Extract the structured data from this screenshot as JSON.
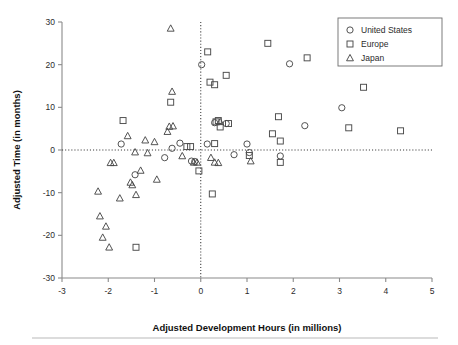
{
  "chart_data": {
    "type": "scatter",
    "title": "",
    "xlabel": "Adjusted Development Hours (in millions)",
    "ylabel": "Adjusted Time (in months)",
    "xlim": [
      -3,
      5
    ],
    "ylim": [
      -30,
      30
    ],
    "xticks": [
      -3,
      -2,
      -1,
      0,
      1,
      2,
      3,
      4,
      5
    ],
    "yticks": [
      -30,
      -20,
      -10,
      0,
      10,
      20,
      30
    ],
    "xtick_labels": [
      "-3",
      "-2",
      "-1",
      "0",
      "1",
      "2",
      "3",
      "4",
      "5"
    ],
    "ytick_labels": [
      "-30",
      "-20",
      "-10",
      "0",
      "10",
      "20",
      "30"
    ],
    "grid": false,
    "reference_lines": [
      {
        "axis": "y",
        "value": 0,
        "style": "dotted"
      },
      {
        "axis": "x",
        "value": 0,
        "style": "dotted"
      }
    ],
    "legend_position": "top-right",
    "series": [
      {
        "name": "United States",
        "marker": "circle",
        "points": [
          [
            -1.72,
            1.4
          ],
          [
            -1.42,
            -5.8
          ],
          [
            -0.78,
            -1.8
          ],
          [
            -0.62,
            0.4
          ],
          [
            -0.45,
            1.6
          ],
          [
            -0.2,
            -2.6
          ],
          [
            -0.13,
            -2.7
          ],
          [
            0.02,
            20.0
          ],
          [
            0.14,
            1.4
          ],
          [
            0.3,
            6.4
          ],
          [
            0.55,
            6.2
          ],
          [
            0.72,
            -1.1
          ],
          [
            1.0,
            1.4
          ],
          [
            1.05,
            -0.6
          ],
          [
            1.72,
            -1.4
          ],
          [
            1.92,
            20.2
          ],
          [
            2.25,
            5.7
          ],
          [
            3.05,
            9.9
          ]
        ]
      },
      {
        "name": "Europe",
        "marker": "square",
        "points": [
          [
            -1.68,
            6.9
          ],
          [
            -1.4,
            -22.8
          ],
          [
            -0.65,
            11.2
          ],
          [
            -0.3,
            0.8
          ],
          [
            -0.22,
            0.8
          ],
          [
            -0.04,
            -4.9
          ],
          [
            0.15,
            23.0
          ],
          [
            0.2,
            15.9
          ],
          [
            0.3,
            15.3
          ],
          [
            0.33,
            6.6
          ],
          [
            0.38,
            6.9
          ],
          [
            0.42,
            5.4
          ],
          [
            0.55,
            17.5
          ],
          [
            0.6,
            6.2
          ],
          [
            0.25,
            -10.3
          ],
          [
            1.05,
            -1.3
          ],
          [
            1.45,
            25.0
          ],
          [
            1.55,
            3.8
          ],
          [
            1.68,
            7.8
          ],
          [
            1.72,
            2.1
          ],
          [
            1.72,
            -2.9
          ],
          [
            2.3,
            21.6
          ],
          [
            3.2,
            5.2
          ],
          [
            3.52,
            14.7
          ],
          [
            4.32,
            4.5
          ],
          [
            0.3,
            1.5
          ]
        ]
      },
      {
        "name": "Japan",
        "marker": "triangle",
        "points": [
          [
            -2.22,
            -9.7
          ],
          [
            -2.18,
            -15.5
          ],
          [
            -2.12,
            -20.5
          ],
          [
            -2.05,
            -17.9
          ],
          [
            -1.98,
            -22.8
          ],
          [
            -1.95,
            -3.0
          ],
          [
            -1.88,
            -3.0
          ],
          [
            -1.75,
            -11.3
          ],
          [
            -1.58,
            3.3
          ],
          [
            -1.52,
            -7.6
          ],
          [
            -1.48,
            -8.2
          ],
          [
            -1.42,
            -0.5
          ],
          [
            -1.4,
            -10.5
          ],
          [
            -1.3,
            -4.8
          ],
          [
            -1.2,
            2.3
          ],
          [
            -1.15,
            -0.7
          ],
          [
            -1.0,
            1.9
          ],
          [
            -0.95,
            -6.9
          ],
          [
            -0.68,
            5.5
          ],
          [
            -0.62,
            13.7
          ],
          [
            -0.6,
            5.6
          ],
          [
            -0.65,
            28.5
          ],
          [
            -0.72,
            4.3
          ],
          [
            -0.4,
            -1.4
          ],
          [
            -0.15,
            -2.9
          ],
          [
            -0.08,
            -2.9
          ],
          [
            0.22,
            -1.8
          ],
          [
            0.3,
            -2.9
          ],
          [
            0.38,
            -3.0
          ],
          [
            0.42,
            6.6
          ],
          [
            1.08,
            -2.6
          ]
        ]
      }
    ]
  },
  "legend": {
    "entries": [
      {
        "label": "United States",
        "marker": "circle-icon"
      },
      {
        "label": "Europe",
        "marker": "square-icon"
      },
      {
        "label": "Japan",
        "marker": "triangle-icon"
      }
    ]
  },
  "colors": {
    "marker_stroke": "#4a4a4a",
    "axis": "#8a8a8a",
    "text": "#1a1a1a",
    "reference_line": "#3a3a3a",
    "footer_rule": "#b9b9b9"
  }
}
